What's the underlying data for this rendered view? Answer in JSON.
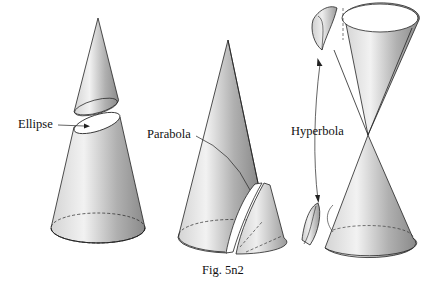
{
  "figure": {
    "caption": "Fig. 5n2",
    "labels": {
      "ellipse": "Ellipse",
      "parabola": "Parabola",
      "hyperbola": "Hyperbola"
    }
  },
  "panels": [
    {
      "name": "ellipse-section",
      "description": "Cone cut by inclined plane; top cut off, elliptical section exposed"
    },
    {
      "name": "parabola-section",
      "description": "Cone cut by plane parallel to a generator; parabolic piece separated"
    },
    {
      "name": "hyperbola-section",
      "description": "Double cone cut by steep plane; two hyperbolic pieces removed"
    }
  ]
}
